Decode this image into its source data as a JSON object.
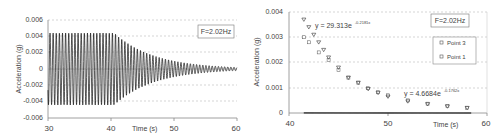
{
  "chart_data": [
    {
      "type": "line",
      "title": "",
      "xlabel": "Time (s)",
      "ylabel": "Acceleration (g)",
      "annotation": "F=2.02Hz",
      "xlim": [
        30,
        60
      ],
      "ylim": [
        -0.006,
        0.006
      ],
      "xticks": [
        30,
        40,
        50,
        60
      ],
      "yticks": [
        "0.006",
        "0.004",
        "0.002",
        "0",
        "-0.002",
        "-0.004",
        "-0.006"
      ],
      "grid": "horizontal dashed",
      "series": [
        {
          "name": "Free vibration decay",
          "description": "Sinusoid at 2.02 Hz, amplitude ~0.0044 g from t=30 to ~40.5 s, then exponential decay to ~0.0002 g at t=60 s",
          "frequency_hz": 2.02,
          "steady_amplitude": 0.0044,
          "decay_start": 40.5,
          "final_amplitude": 0.0002
        }
      ]
    },
    {
      "type": "scatter",
      "title": "",
      "xlabel": "Time (s)",
      "ylabel": "Acceleration (g)",
      "annotation": "F=2.02Hz",
      "xlim": [
        40,
        60
      ],
      "ylim": [
        0,
        0.004
      ],
      "xticks": [
        40,
        50,
        60
      ],
      "yticks": [
        "0.004",
        "0.003",
        "0.002",
        "0.001",
        "0"
      ],
      "grid": "horizontal dashed",
      "legend": [
        "Point 3",
        "Point 1"
      ],
      "legend_position": "upper right",
      "series": [
        {
          "name": "Point 3",
          "marker": "triangle",
          "x": [
            41.5,
            42,
            42.5,
            43,
            43.5,
            44,
            45,
            46,
            47,
            48,
            49,
            50,
            52,
            54,
            56,
            58
          ],
          "y": [
            0.0037,
            0.0034,
            0.0031,
            0.0028,
            0.0025,
            0.0022,
            0.0018,
            0.0014,
            0.0012,
            0.00095,
            0.0008,
            0.00065,
            0.00046,
            0.00035,
            0.00026,
            0.0002
          ]
        },
        {
          "name": "Point 1",
          "marker": "square",
          "x": [
            41.5,
            42,
            43,
            44,
            45,
            46,
            47,
            48,
            49,
            50,
            52,
            54,
            56,
            58
          ],
          "y": [
            0.003,
            0.0028,
            0.0024,
            0.0021,
            0.0017,
            0.0014,
            0.0012,
            0.00098,
            0.00082,
            0.0007,
            0.0005,
            0.00037,
            0.00028,
            0.00021
          ]
        }
      ],
      "trendlines": [
        {
          "label": "y = 29.313e",
          "exponent": "-0.2181x",
          "a": 29.313,
          "b": -0.2181
        },
        {
          "label": "y = 4.6684e",
          "exponent": "-0.1762x",
          "a": 4.6684,
          "b": -0.1762
        }
      ]
    }
  ],
  "left": {
    "annotation": "F=2.02Hz",
    "xlabel": "Time (s)",
    "ylabel": "Acceleration (g)",
    "yticks": [
      "0.006",
      "0.004",
      "0.002",
      "0",
      "-0.002",
      "-0.004",
      "-0.006"
    ],
    "xticks": [
      "30",
      "40",
      "50",
      "60"
    ]
  },
  "right": {
    "annotation": "F=2.02Hz",
    "xlabel": "Time (s)",
    "ylabel": "Acceleration (g)",
    "yticks": [
      "0.004",
      "0.003",
      "0.002",
      "0.001",
      "0"
    ],
    "xticks": [
      "40",
      "50",
      "60"
    ],
    "legend": [
      "Point 3",
      "Point 1"
    ],
    "eq1": "y = 29.313e",
    "eq1_exp": "-0.2181x",
    "eq2": "y = 4.6684e",
    "eq2_exp": "-0.1762x"
  }
}
